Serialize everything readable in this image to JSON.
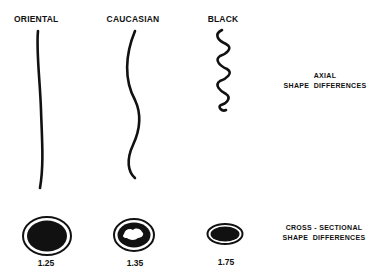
{
  "diagram": {
    "columns": [
      {
        "label": "ORIENTAL",
        "ratio": "1.25",
        "axial": "straight",
        "cross_section": "round"
      },
      {
        "label": "CAUCASIAN",
        "ratio": "1.35",
        "axial": "wavy",
        "cross_section": "oval with medulla"
      },
      {
        "label": "BLACK",
        "ratio": "1.75",
        "axial": "tightly coiled",
        "cross_section": "flattened ellipse"
      }
    ],
    "annotations": {
      "axial_line1": "AXIAL",
      "axial_line2": "SHAPE  DIFFERENCES",
      "cross_line1": "CROSS - SECTIONAL",
      "cross_line2": "SHAPE  DIFFERENCES"
    },
    "colors": {
      "ink": "#111111",
      "background": "#ffffff"
    }
  }
}
